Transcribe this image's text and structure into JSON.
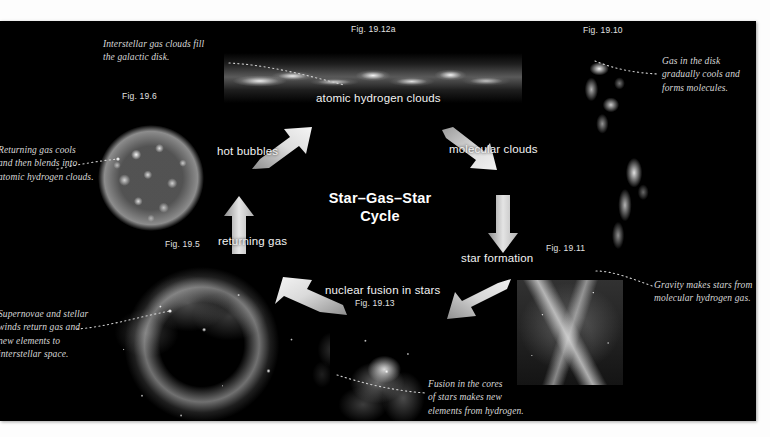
{
  "diagram": {
    "title": "Star–Gas–Star\nCycle",
    "background_color": "#000000",
    "page_color": "#ffffff",
    "label_color": "#f2f2f2",
    "annotation_color": "#d8d8d8"
  },
  "cycle_steps": [
    {
      "id": "atomic-hydrogen-clouds",
      "label": "atomic hydrogen clouds"
    },
    {
      "id": "molecular-clouds",
      "label": "molecular clouds"
    },
    {
      "id": "star-formation",
      "label": "star formation"
    },
    {
      "id": "nuclear-fusion-in-stars",
      "label": "nuclear fusion in stars"
    },
    {
      "id": "returning-gas",
      "label": "returning gas"
    },
    {
      "id": "hot-bubbles",
      "label": "hot bubbles"
    }
  ],
  "figures": [
    {
      "id": "fig-19-12a",
      "label": "Fig. 19.12a"
    },
    {
      "id": "fig-19-10",
      "label": "Fig. 19.10"
    },
    {
      "id": "fig-19-6",
      "label": "Fig. 19.6"
    },
    {
      "id": "fig-19-5",
      "label": "Fig. 19.5"
    },
    {
      "id": "fig-19-11",
      "label": "Fig. 19.11"
    },
    {
      "id": "fig-19-13",
      "label": "Fig. 19.13"
    }
  ],
  "annotations": [
    {
      "id": "annot-interstellar-gas",
      "text": "Interstellar gas clouds fill\nthe galactic disk."
    },
    {
      "id": "annot-gas-cools",
      "text": "Gas in the disk\ngradually cools and\nforms molecules."
    },
    {
      "id": "annot-returning-gas-cools",
      "text": "Returning gas cools\nand then blends into\natomic hydrogen clouds."
    },
    {
      "id": "annot-gravity-makes-stars",
      "text": "Gravity makes stars from\nmolecular hydrogen gas."
    },
    {
      "id": "annot-supernovae",
      "text": "Supernovae and stellar\nwinds return gas and\nnew elements to\ninterstellar space."
    },
    {
      "id": "annot-fusion-cores",
      "text": "Fusion in the cores\nof stars makes new\nelements from hydrogen."
    }
  ]
}
